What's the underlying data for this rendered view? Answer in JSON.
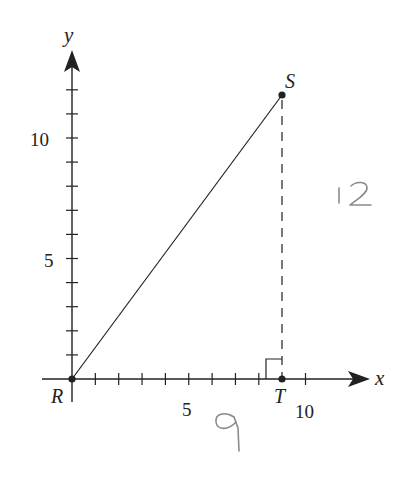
{
  "diagram": {
    "type": "coordinate-plane-right-triangle",
    "axes": {
      "x_label": "x",
      "y_label": "y",
      "x_tick_labels": [
        {
          "value": 5,
          "label": "5"
        },
        {
          "value": 10,
          "label": "10"
        }
      ],
      "y_tick_labels": [
        {
          "value": 5,
          "label": "5"
        },
        {
          "value": 10,
          "label": "10"
        }
      ],
      "x_ticks": [
        1,
        2,
        3,
        4,
        5,
        6,
        7,
        8,
        10
      ],
      "y_ticks": [
        1,
        2,
        3,
        4,
        5,
        6,
        7,
        8,
        9,
        10,
        11,
        12
      ]
    },
    "points": [
      {
        "name": "R",
        "x": 0,
        "y": 0
      },
      {
        "name": "S",
        "x": 9,
        "y": 12
      },
      {
        "name": "T",
        "x": 9,
        "y": 0
      }
    ],
    "segments": [
      {
        "from": "R",
        "to": "S",
        "style": "solid"
      },
      {
        "from": "S",
        "to": "T",
        "style": "dashed"
      }
    ],
    "right_angle_at": "T",
    "handwritten_annotations": [
      {
        "text": "12",
        "position": "right of dashed segment ST"
      },
      {
        "text": "9",
        "position": "below x-axis segment RT"
      }
    ],
    "colors": {
      "ink": "#222222",
      "pencil": "#8a8a8a",
      "background": "#ffffff"
    }
  }
}
